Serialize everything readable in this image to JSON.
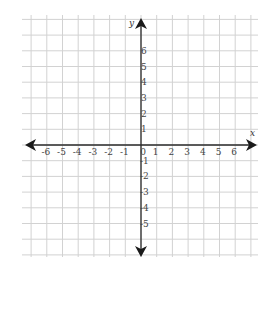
{
  "chart_data": {
    "type": "scatter",
    "title": "",
    "xlabel": "x",
    "ylabel": "y",
    "xlim": [
      -7,
      7
    ],
    "ylim": [
      -7,
      7
    ],
    "x_ticks": [
      -6,
      -5,
      -4,
      -3,
      -2,
      -1,
      0,
      1,
      2,
      3,
      4,
      5,
      6
    ],
    "x_tick_labels": [
      "-6",
      "-5",
      "-4",
      "-3",
      "-2",
      "-1",
      "0",
      "1",
      "2",
      "3",
      "4",
      "5",
      "6"
    ],
    "y_ticks": [
      6,
      5,
      4,
      3,
      2,
      1,
      -1,
      -2,
      -3,
      -4,
      -5
    ],
    "y_tick_labels": [
      "6",
      "5",
      "4",
      "3",
      "2",
      "1",
      "-1",
      "-2",
      "-3",
      "-4",
      "-5"
    ],
    "grid": true,
    "grid_range": {
      "x": [
        -7,
        7
      ],
      "y": [
        -6,
        8
      ]
    },
    "series": [],
    "colors": {
      "grid": "#d2d2d2",
      "axis": "#2b2b2b",
      "text": "#444444"
    }
  }
}
